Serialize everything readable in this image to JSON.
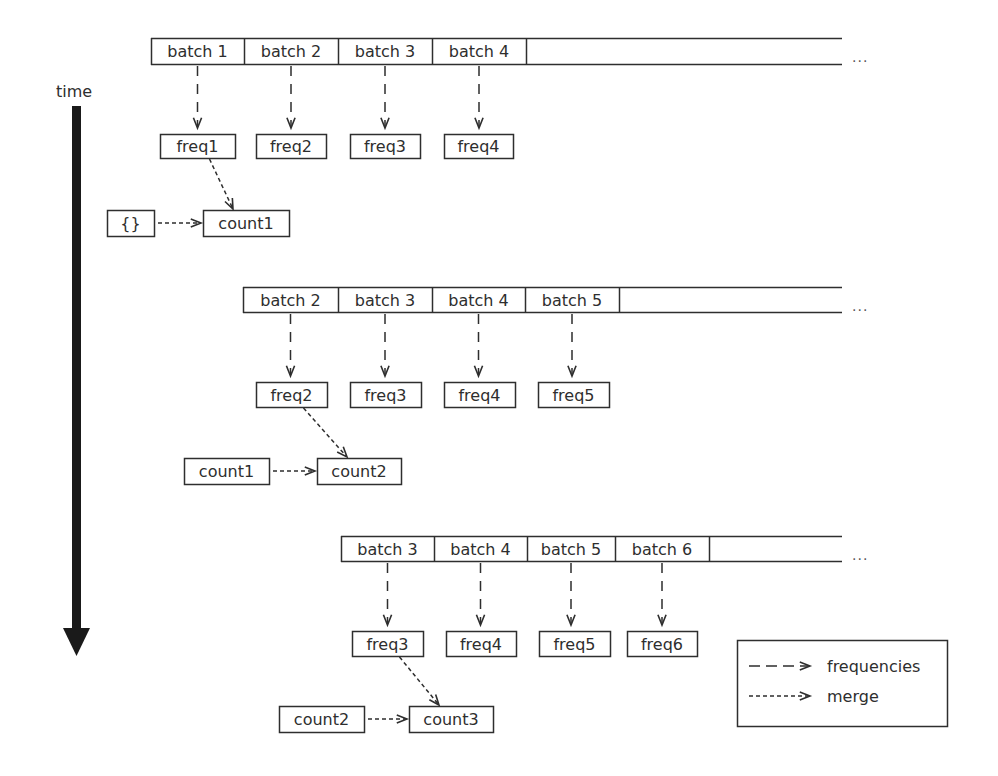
{
  "time_axis": {
    "label": "time",
    "x": 76,
    "label_y": 92,
    "top": 106,
    "bottom": 656
  },
  "colors": {
    "stroke": "#2e2e2e",
    "arrow_fill": "#1a1a1a",
    "background": "#ffffff"
  },
  "streams": [
    {
      "top": 38,
      "bottom": 64,
      "left": 151,
      "open_end": 842,
      "ellipsis": "...",
      "ellipsis_x": 852,
      "batches": [
        {
          "label": "batch 1",
          "x0": 151,
          "x1": 244
        },
        {
          "label": "batch 2",
          "x0": 244,
          "x1": 338
        },
        {
          "label": "batch 3",
          "x0": 338,
          "x1": 432
        },
        {
          "label": "batch 4",
          "x0": 432,
          "x1": 526
        }
      ],
      "freq_top": 134,
      "freq_bottom": 158,
      "freqs": [
        {
          "label": "freq1",
          "x0": 160,
          "x1": 235
        },
        {
          "label": "freq2",
          "x0": 256,
          "x1": 326
        },
        {
          "label": "freq3",
          "x0": 350,
          "x1": 420
        },
        {
          "label": "freq4",
          "x0": 444,
          "x1": 513
        }
      ],
      "prev": {
        "label": "{}",
        "x0": 107,
        "x1": 154,
        "top": 210,
        "bottom": 236
      },
      "count": {
        "label": "count1",
        "x0": 203,
        "x1": 289,
        "top": 210,
        "bottom": 236
      }
    },
    {
      "top": 287,
      "bottom": 312,
      "left": 243,
      "open_end": 842,
      "ellipsis": "...",
      "ellipsis_x": 852,
      "batches": [
        {
          "label": "batch 2",
          "x0": 243,
          "x1": 338
        },
        {
          "label": "batch 3",
          "x0": 338,
          "x1": 432
        },
        {
          "label": "batch 4",
          "x0": 432,
          "x1": 525
        },
        {
          "label": "batch 5",
          "x0": 525,
          "x1": 619
        }
      ],
      "freq_top": 382,
      "freq_bottom": 407,
      "freqs": [
        {
          "label": "freq2",
          "x0": 256,
          "x1": 327
        },
        {
          "label": "freq3",
          "x0": 350,
          "x1": 421
        },
        {
          "label": "freq4",
          "x0": 444,
          "x1": 515
        },
        {
          "label": "freq5",
          "x0": 538,
          "x1": 609
        }
      ],
      "prev": {
        "label": "count1",
        "x0": 184,
        "x1": 269,
        "top": 458,
        "bottom": 484
      },
      "count": {
        "label": "count2",
        "x0": 317,
        "x1": 401,
        "top": 458,
        "bottom": 484
      }
    },
    {
      "top": 536,
      "bottom": 561,
      "left": 341,
      "open_end": 842,
      "ellipsis": "...",
      "ellipsis_x": 852,
      "batches": [
        {
          "label": "batch 3",
          "x0": 341,
          "x1": 434
        },
        {
          "label": "batch 4",
          "x0": 434,
          "x1": 527
        },
        {
          "label": "batch 5",
          "x0": 527,
          "x1": 615
        },
        {
          "label": "batch 6",
          "x0": 615,
          "x1": 709
        }
      ],
      "freq_top": 631,
      "freq_bottom": 656,
      "freqs": [
        {
          "label": "freq3",
          "x0": 352,
          "x1": 423
        },
        {
          "label": "freq4",
          "x0": 446,
          "x1": 516
        },
        {
          "label": "freq5",
          "x0": 539,
          "x1": 610
        },
        {
          "label": "freq6",
          "x0": 627,
          "x1": 697
        }
      ],
      "prev": {
        "label": "count2",
        "x0": 279,
        "x1": 364,
        "top": 706,
        "bottom": 732
      },
      "count": {
        "label": "count3",
        "x0": 409,
        "x1": 493,
        "top": 706,
        "bottom": 732
      }
    }
  ],
  "legend": {
    "x0": 737,
    "y0": 640,
    "x1": 947,
    "y1": 726,
    "items": [
      {
        "style": "dashed-long",
        "label": "frequencies"
      },
      {
        "style": "dashed-short",
        "label": "merge"
      }
    ]
  }
}
